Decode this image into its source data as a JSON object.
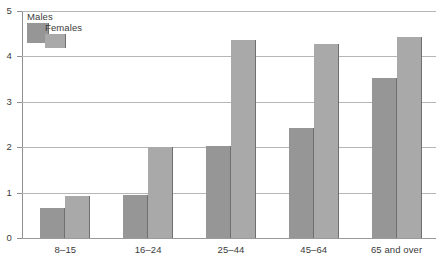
{
  "chart_data": {
    "type": "bar",
    "title": "",
    "subtitle": "",
    "xlabel": "",
    "ylabel": "",
    "categories": [
      "8–15",
      "16–24",
      "25–44",
      "45–64",
      "65 and over"
    ],
    "series": [
      {
        "name": "Males",
        "color": "#969696",
        "values": [
          0.67,
          0.95,
          2.03,
          2.43,
          3.53
        ]
      },
      {
        "name": "Females",
        "color": "#a9a9a9",
        "values": [
          0.92,
          2.0,
          4.37,
          4.28,
          4.43
        ]
      }
    ],
    "ylim": [
      0,
      5
    ],
    "yticks": [
      0,
      1,
      2,
      3,
      4,
      5
    ],
    "ytick_labels": [
      "0",
      "1",
      "2",
      "3",
      "4",
      "5"
    ],
    "grid": true,
    "grid_axis": "y",
    "legend_position": "top-left",
    "bar_mode": "grouped"
  },
  "legend": {
    "entries": [
      {
        "label": "Males",
        "color": "#969696"
      },
      {
        "label": "Females",
        "color": "#a9a9a9"
      }
    ]
  },
  "colors": {
    "males": "#969696",
    "females": "#a9a9a9",
    "gridline": "#b6b6b6",
    "axis": "#8f8f8f",
    "text": "#3b3b3b",
    "background": "#ffffff"
  }
}
